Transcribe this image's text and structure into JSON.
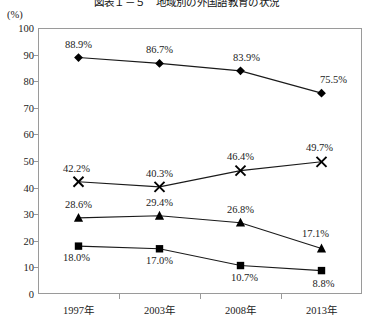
{
  "chart_data": {
    "type": "line",
    "title": "図表１－５　地域別の外国語教育の状況",
    "unit_label": "(%)",
    "categories": [
      "1997年",
      "2003年",
      "2008年",
      "2013年"
    ],
    "xlabel": "",
    "ylabel": "(%)",
    "ylim": [
      0,
      100
    ],
    "ytick_step": 10,
    "yticks": [
      "100",
      "90",
      "80",
      "70",
      "60",
      "50",
      "40",
      "30",
      "20",
      "10",
      "0"
    ],
    "grid": false,
    "legend": "none",
    "series": [
      {
        "name": "series-diamond",
        "marker": "diamond",
        "values": [
          88.9,
          86.7,
          83.9,
          75.5
        ],
        "labels": [
          "88.9%",
          "86.7%",
          "83.9%",
          "75.5%"
        ]
      },
      {
        "name": "series-cross",
        "marker": "cross",
        "values": [
          42.2,
          40.3,
          46.4,
          49.7
        ],
        "labels": [
          "42.2%",
          "40.3%",
          "46.4%",
          "49.7%"
        ]
      },
      {
        "name": "series-triangle",
        "marker": "triangle",
        "values": [
          28.6,
          29.4,
          26.8,
          17.1
        ],
        "labels": [
          "28.6%",
          "29.4%",
          "26.8%",
          "17.1%"
        ]
      },
      {
        "name": "series-square",
        "marker": "square",
        "values": [
          18.0,
          17.0,
          10.7,
          8.8
        ],
        "labels": [
          "18.0%",
          "17.0%",
          "10.7%",
          "8.8%"
        ]
      }
    ],
    "colors": {
      "line": "#1a1a1a",
      "marker": "#000000",
      "axis": "#9a9a9a",
      "text": "#222222",
      "background": "#ffffff"
    }
  }
}
